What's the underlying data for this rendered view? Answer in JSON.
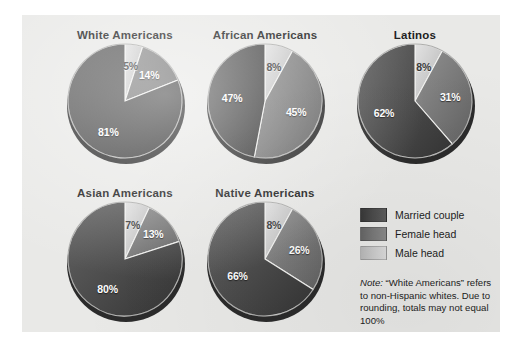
{
  "figure": {
    "background_color": "#e9e9e7",
    "page_background": "#ffffff"
  },
  "legend": {
    "title": "",
    "items": [
      {
        "label": "Married couple",
        "color": "#4a4a4a",
        "key": "married"
      },
      {
        "label": "Female head",
        "color": "#777777",
        "key": "female"
      },
      {
        "label": "Male head",
        "color": "#c9c9c9",
        "key": "male"
      }
    ]
  },
  "note": {
    "word": "Note:",
    "text": " “White Americans” refers to non-Hispanic whites. Due to rounding, totals may not equal 100%"
  },
  "chart_data": [
    {
      "type": "pie",
      "title": "White Americans",
      "categories": [
        "Male head",
        "Female head",
        "Married couple"
      ],
      "values": [
        5,
        14,
        81
      ],
      "labels": [
        "5%",
        "14%",
        "81%"
      ],
      "colors": [
        "#c9c9c9",
        "#777777",
        "#4a4a4a"
      ],
      "start_angle": 0,
      "direction": "clockwise"
    },
    {
      "type": "pie",
      "title": "African Americans",
      "categories": [
        "Male head",
        "Female head",
        "Married couple"
      ],
      "values": [
        8,
        45,
        47
      ],
      "labels": [
        "8%",
        "45%",
        "47%"
      ],
      "colors": [
        "#c9c9c9",
        "#777777",
        "#4a4a4a"
      ],
      "start_angle": 0,
      "direction": "clockwise"
    },
    {
      "type": "pie",
      "title": "Latinos",
      "categories": [
        "Male head",
        "Female head",
        "Married couple"
      ],
      "values": [
        8,
        31,
        62
      ],
      "labels": [
        "8%",
        "31%",
        "62%"
      ],
      "colors": [
        "#c9c9c9",
        "#777777",
        "#4a4a4a"
      ],
      "start_angle": 0,
      "direction": "clockwise"
    },
    {
      "type": "pie",
      "title": "Asian Americans",
      "categories": [
        "Male head",
        "Female head",
        "Married couple"
      ],
      "values": [
        7,
        13,
        80
      ],
      "labels": [
        "7%",
        "13%",
        "80%"
      ],
      "colors": [
        "#c9c9c9",
        "#777777",
        "#4a4a4a"
      ],
      "start_angle": 0,
      "direction": "clockwise"
    },
    {
      "type": "pie",
      "title": "Native Americans",
      "categories": [
        "Male head",
        "Female head",
        "Married couple"
      ],
      "values": [
        8,
        26,
        66
      ],
      "labels": [
        "8%",
        "26%",
        "66%"
      ],
      "colors": [
        "#c9c9c9",
        "#777777",
        "#4a4a4a"
      ],
      "start_angle": 0,
      "direction": "clockwise"
    }
  ],
  "layout": {
    "positions": [
      {
        "left": 28,
        "top": 14
      },
      {
        "left": 168,
        "top": 14
      },
      {
        "left": 318,
        "top": 14
      },
      {
        "left": 28,
        "top": 172
      },
      {
        "left": 168,
        "top": 172
      }
    ],
    "label_offsets": [
      [
        {
          "r": 0.62,
          "nudge_x": 0,
          "nudge_y": 0
        },
        {
          "r": 0.62,
          "nudge_x": 0,
          "nudge_y": 0
        },
        {
          "r": 0.52,
          "nudge_x": 0,
          "nudge_y": 6
        }
      ],
      [
        {
          "r": 0.62,
          "nudge_x": 0,
          "nudge_y": 0
        },
        {
          "r": 0.58,
          "nudge_x": 0,
          "nudge_y": 0
        },
        {
          "r": 0.58,
          "nudge_x": 0,
          "nudge_y": 0
        }
      ],
      [
        {
          "r": 0.62,
          "nudge_x": 0,
          "nudge_y": 0
        },
        {
          "r": 0.62,
          "nudge_x": 0,
          "nudge_y": 0
        },
        {
          "r": 0.58,
          "nudge_x": 0,
          "nudge_y": 0
        }
      ],
      [
        {
          "r": 0.62,
          "nudge_x": 0,
          "nudge_y": 0
        },
        {
          "r": 0.66,
          "nudge_x": 0,
          "nudge_y": 0
        },
        {
          "r": 0.52,
          "nudge_x": 0,
          "nudge_y": 6
        }
      ],
      [
        {
          "r": 0.62,
          "nudge_x": 0,
          "nudge_y": 0
        },
        {
          "r": 0.62,
          "nudge_x": 0,
          "nudge_y": 0
        },
        {
          "r": 0.55,
          "nudge_x": 0,
          "nudge_y": 2
        }
      ]
    ]
  }
}
